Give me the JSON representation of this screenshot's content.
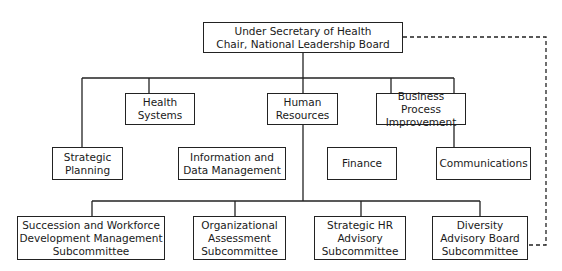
{
  "chart_title": "",
  "colors": {
    "line": "#222222",
    "background": "#ffffff"
  },
  "top": {
    "label": "Under Secretary of Health\nChair, National Leadership Board"
  },
  "level1": [
    {
      "id": "health-systems",
      "label": "Health\nSystems"
    },
    {
      "id": "human-resources",
      "label": "Human\nResources"
    },
    {
      "id": "business-process-improvement",
      "label": "Business Process\nImprovement"
    }
  ],
  "level2": [
    {
      "id": "strategic-planning",
      "label": "Strategic\nPlanning"
    },
    {
      "id": "information-data-management",
      "label": "Information and\nData Management"
    },
    {
      "id": "finance",
      "label": "Finance"
    },
    {
      "id": "communications",
      "label": "Communications"
    }
  ],
  "subcommittees": [
    {
      "id": "succession-workforce",
      "label": "Succession and Workforce\nDevelopment Management\nSubcommittee"
    },
    {
      "id": "organizational-assessment",
      "label": "Organizational\nAssessment\nSubcommittee"
    },
    {
      "id": "strategic-hr-advisory",
      "label": "Strategic HR\nAdvisory\nSubcommittee"
    },
    {
      "id": "diversity-advisory-board",
      "label": "Diversity\nAdvisory Board\nSubcommittee"
    }
  ],
  "connections": [
    {
      "from": "top",
      "to": "strategic-planning",
      "style": "solid"
    },
    {
      "from": "top",
      "to": "health-systems",
      "style": "solid"
    },
    {
      "from": "top",
      "to": "human-resources",
      "style": "solid"
    },
    {
      "from": "top",
      "to": "business-process-improvement",
      "style": "solid"
    },
    {
      "from": "top",
      "to": "communications",
      "style": "solid"
    },
    {
      "from": "human-resources",
      "to": "succession-workforce",
      "style": "solid"
    },
    {
      "from": "human-resources",
      "to": "organizational-assessment",
      "style": "solid"
    },
    {
      "from": "human-resources",
      "to": "strategic-hr-advisory",
      "style": "solid"
    },
    {
      "from": "human-resources",
      "to": "diversity-advisory-board",
      "style": "solid"
    },
    {
      "from": "top",
      "to": "diversity-advisory-board",
      "style": "dashed"
    }
  ]
}
